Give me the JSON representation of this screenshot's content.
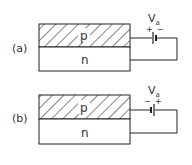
{
  "diagrams": [
    {
      "label": "(a)",
      "top_region": "p",
      "bottom_region": "n",
      "source_label": "V",
      "source_subscript": "a",
      "left_sign": "+",
      "right_sign": "−"
    },
    {
      "label": "(b)",
      "top_region": "p",
      "bottom_region": "n",
      "source_label": "V",
      "source_subscript": "a",
      "left_sign": "−",
      "right_sign": "+"
    }
  ],
  "colors": {
    "line": "#222222",
    "text": "#333333",
    "background": "#ffffff"
  }
}
